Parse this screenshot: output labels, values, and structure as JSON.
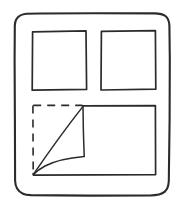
{
  "canvas": {
    "width": 187,
    "height": 210,
    "background_color": "#ffffff",
    "ink_color": "#2b2b2b",
    "style": "hand-drawn sketch, monochrome line art, no text labels"
  },
  "diagram": {
    "title": "",
    "shapes": [
      {
        "id": "outer-frame",
        "name": "outer-frame",
        "type": "rounded-rectangle",
        "line_style": "solid",
        "x": 14,
        "y": 13,
        "width": 160,
        "height": 183,
        "corner_radius": 11
      },
      {
        "id": "top-left-square",
        "name": "top-left-square",
        "type": "rectangle",
        "line_style": "solid",
        "x": 32,
        "y": 31,
        "width": 54,
        "height": 59
      },
      {
        "id": "top-right-square",
        "name": "top-right-square",
        "type": "rectangle",
        "line_style": "solid",
        "x": 101,
        "y": 31,
        "width": 54,
        "height": 59
      },
      {
        "id": "bottom-panel",
        "name": "bottom-panel",
        "type": "rectangle",
        "line_style": "solid",
        "x": 33,
        "y": 106,
        "width": 122,
        "height": 69,
        "note": "top edge only drawn from x=82 rightward; left edge replaced by dashed outline because of the peeled corner"
      },
      {
        "id": "hidden-area-outline",
        "name": "hidden-area-dashed-outline",
        "type": "dashed-corner-outline",
        "line_style": "dashed",
        "dash_pattern": "8 6",
        "points": "top edge from (33,105) to (82,105); left edge from (33,105) to (33,174)"
      },
      {
        "id": "curl-fold-diagonal",
        "name": "curl-fold-diagonal",
        "type": "line",
        "line_style": "solid",
        "from": [
          33,
          174
        ],
        "to": [
          83,
          106
        ]
      },
      {
        "id": "curl-right-edge",
        "name": "curl-right-edge",
        "type": "line",
        "line_style": "solid",
        "from": [
          83,
          106
        ],
        "to": [
          84,
          156
        ]
      },
      {
        "id": "curl-curved-edge",
        "name": "curl-curved-edge",
        "type": "curve",
        "line_style": "solid",
        "from": [
          84,
          156
        ],
        "control": [
          55,
          158
        ],
        "to": [
          33,
          174
        ]
      }
    ]
  }
}
